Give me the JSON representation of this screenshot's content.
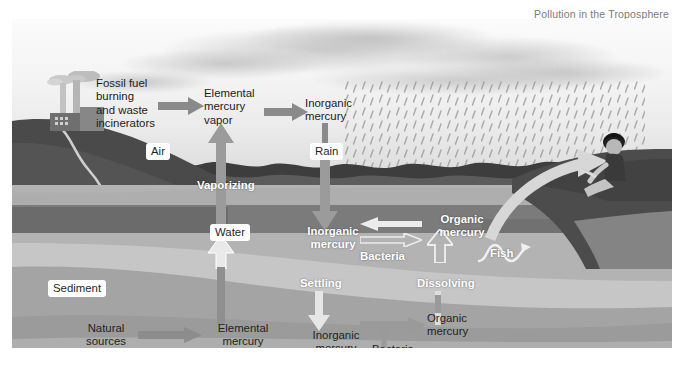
{
  "caption": "Pollution in the Troposphere",
  "diagram": {
    "zones": {
      "air": "Air",
      "water": "Water",
      "sediment": "Sediment"
    },
    "air_stage": {
      "source": "Fossil fuel\nburning\nand waste\nincinerators",
      "elemental_vapor": "Elemental\nmercury\nvapor",
      "inorganic": "Inorganic\nmercury",
      "rain": "Rain",
      "vaporizing": "Vaporizing"
    },
    "water_stage": {
      "inorganic": "Inorganic\nmercury",
      "organic": "Organic\nmercury",
      "bacteria": "Bacteria",
      "fish": "Fish",
      "settling": "Settling",
      "dissolving": "Dissolving"
    },
    "sediment_stage": {
      "natural_sources": "Natural\nsources",
      "elemental": "Elemental\nmercury",
      "inorganic": "Inorganic\nmercury",
      "bacteria": "Bacteria",
      "organic": "Organic\nmercury"
    },
    "colors": {
      "arrow_grey": "#8a8a8a",
      "arrow_white": "#f2f2f2",
      "sky": "#f6f6f6",
      "water": "#787878",
      "sediment_light": "#c9c9c9",
      "sediment_mid": "#a6a6a6",
      "label_text": "#1c1c1c",
      "caption_text": "#7a7a7a"
    }
  }
}
